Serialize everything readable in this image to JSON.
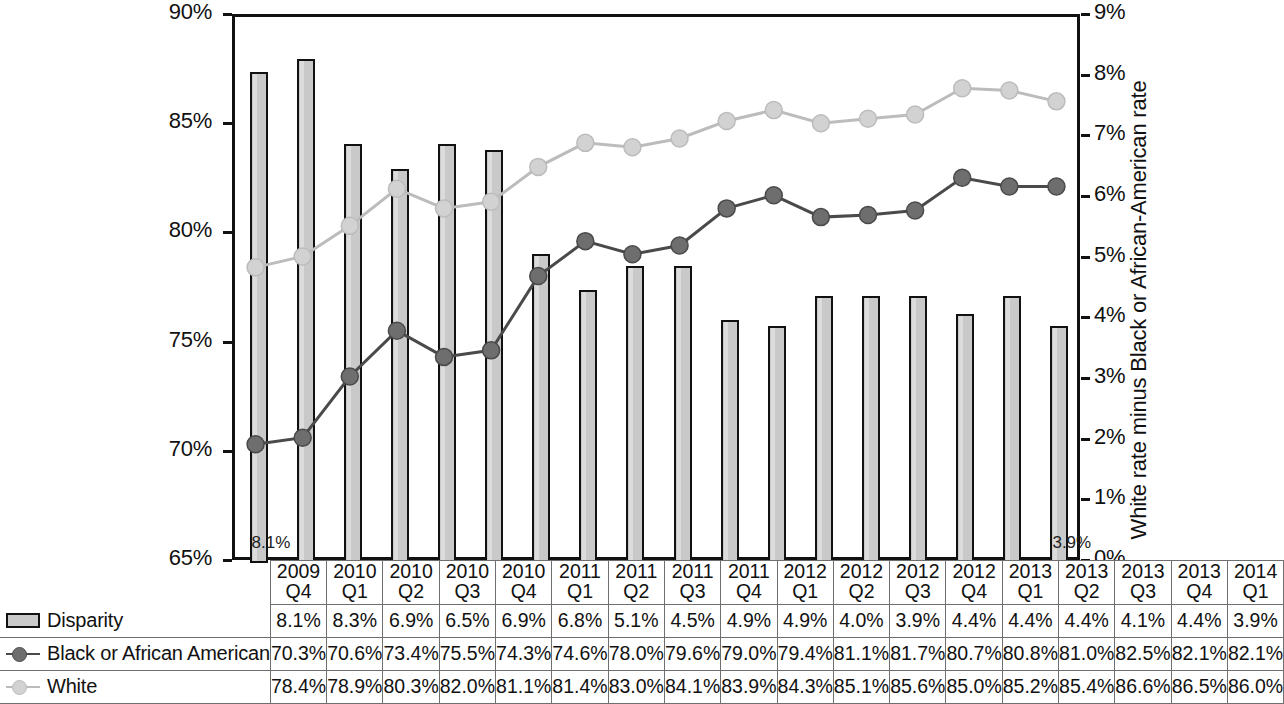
{
  "chart_data": {
    "type": "bar",
    "title": "",
    "subtitle": "",
    "xlabel": "",
    "ylabel_left": "",
    "ylabel_right": "White rate minus Black or African-American rate",
    "grid": false,
    "legend_position": "bottom-left-table",
    "categories": [
      "2009 Q4",
      "2010 Q1",
      "2010 Q2",
      "2010 Q3",
      "2010 Q4",
      "2011 Q1",
      "2011 Q2",
      "2011 Q3",
      "2011 Q4",
      "2012 Q1",
      "2012 Q2",
      "2012 Q3",
      "2012 Q4",
      "2013 Q1",
      "2013 Q2",
      "2013 Q3",
      "2013 Q4",
      "2014 Q1"
    ],
    "category_years": [
      "2009",
      "2010",
      "2010",
      "2010",
      "2010",
      "2011",
      "2011",
      "2011",
      "2011",
      "2012",
      "2012",
      "2012",
      "2012",
      "2013",
      "2013",
      "2013",
      "2013",
      "2014"
    ],
    "category_quarters": [
      "Q4",
      "Q1",
      "Q2",
      "Q3",
      "Q4",
      "Q1",
      "Q2",
      "Q3",
      "Q4",
      "Q1",
      "Q2",
      "Q3",
      "Q4",
      "Q1",
      "Q2",
      "Q3",
      "Q4",
      "Q1"
    ],
    "series": [
      {
        "name": "Disparity",
        "render": "bar",
        "axis": "right",
        "color": "#c9c9c9",
        "edge_color": "#111111",
        "values": [
          8.1,
          8.3,
          6.9,
          6.5,
          6.9,
          6.8,
          5.1,
          4.5,
          4.9,
          4.9,
          4.0,
          3.9,
          4.4,
          4.4,
          4.4,
          4.1,
          4.4,
          3.9
        ],
        "labels": [
          "8.1%",
          "8.3%",
          "6.9%",
          "6.5%",
          "6.9%",
          "6.8%",
          "5.1%",
          "4.5%",
          "4.9%",
          "4.9%",
          "4.0%",
          "3.9%",
          "4.4%",
          "4.4%",
          "4.4%",
          "4.1%",
          "4.4%",
          "3.9%"
        ]
      },
      {
        "name": "Black or African American",
        "render": "line",
        "axis": "left",
        "color": "#6e6e6e",
        "edge_color": "#4a4a4a",
        "values": [
          70.3,
          70.6,
          73.4,
          75.5,
          74.3,
          74.6,
          78.0,
          79.6,
          79.0,
          79.4,
          81.1,
          81.7,
          80.7,
          80.8,
          81.0,
          82.5,
          82.1,
          82.1
        ],
        "labels": [
          "70.3%",
          "70.6%",
          "73.4%",
          "75.5%",
          "74.3%",
          "74.6%",
          "78.0%",
          "79.6%",
          "79.0%",
          "79.4%",
          "81.1%",
          "81.7%",
          "80.7%",
          "80.8%",
          "81.0%",
          "82.5%",
          "82.1%",
          "82.1%"
        ]
      },
      {
        "name": "White",
        "render": "line",
        "axis": "left",
        "color": "#d2d2d2",
        "edge_color": "#bcbcbc",
        "values": [
          78.4,
          78.9,
          80.3,
          82.0,
          81.1,
          81.4,
          83.0,
          84.1,
          83.9,
          84.3,
          85.1,
          85.6,
          85.0,
          85.2,
          85.4,
          86.6,
          86.5,
          86.0
        ],
        "labels": [
          "78.4%",
          "78.9%",
          "80.3%",
          "82.0%",
          "81.1%",
          "81.4%",
          "83.0%",
          "84.1%",
          "83.9%",
          "84.3%",
          "85.1%",
          "85.6%",
          "85.0%",
          "85.2%",
          "85.4%",
          "86.6%",
          "86.5%",
          "86.0%"
        ]
      }
    ],
    "left_axis": {
      "min": 65,
      "max": 90,
      "step": 5,
      "ticks": [
        "65%",
        "70%",
        "75%",
        "80%",
        "85%",
        "90%"
      ],
      "tick_values": [
        65,
        70,
        75,
        80,
        85,
        90
      ]
    },
    "right_axis": {
      "min": 0,
      "max": 9,
      "step": 1,
      "ticks": [
        "0%",
        "1%",
        "2%",
        "3%",
        "4%",
        "5%",
        "6%",
        "7%",
        "8%",
        "9%"
      ],
      "tick_values": [
        0,
        1,
        2,
        3,
        4,
        5,
        6,
        7,
        8,
        9
      ],
      "title": "White rate minus Black or African-American rate"
    },
    "annotations": [
      {
        "text": "8.1%",
        "at_category": "2009 Q4",
        "position": "bottom-left-in-plot"
      },
      {
        "text": "3.9%",
        "at_category": "2014 Q1",
        "position": "bottom-right-in-plot"
      }
    ]
  },
  "legend": {
    "items": [
      {
        "label": "Disparity",
        "marker": "bar-swatch",
        "color": "#c9c9c9"
      },
      {
        "label": "Black or African American",
        "marker": "line-dot",
        "color": "#6e6e6e"
      },
      {
        "label": "White",
        "marker": "line-dot",
        "color": "#d2d2d2"
      }
    ]
  }
}
